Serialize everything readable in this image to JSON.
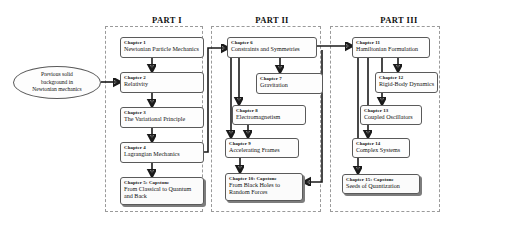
{
  "diagram": {
    "title_parts": [
      {
        "id": "part-1",
        "label": "PART I"
      },
      {
        "id": "part-2",
        "label": "PART II"
      },
      {
        "id": "part-3",
        "label": "PART III"
      }
    ],
    "entry": {
      "id": "previous-background",
      "text": "Previous solid background in Newtonian mechanics",
      "line1": "Previous solid",
      "line2": "background in",
      "line3": "Newtonian mechanics"
    },
    "nodes": [
      {
        "id": "chapter-1",
        "part": 1,
        "chapter": "Chapter 1",
        "title": "Newtonian Particle Mechanics",
        "capstone": false
      },
      {
        "id": "chapter-2",
        "part": 1,
        "chapter": "Chapter 2",
        "title": "Relativity",
        "capstone": false
      },
      {
        "id": "chapter-3",
        "part": 1,
        "chapter": "Chapter 3",
        "title": "The Variational Principle",
        "capstone": false
      },
      {
        "id": "chapter-4",
        "part": 1,
        "chapter": "Chapter 4",
        "title": "Lagrangian Mechanics",
        "capstone": false
      },
      {
        "id": "chapter-5",
        "part": 1,
        "chapter": "Chapter 5: Capstone",
        "title": "From Classical to Quantum and Back",
        "capstone": true
      },
      {
        "id": "chapter-6",
        "part": 2,
        "chapter": "Chapter 6",
        "title": "Constraints and Symmetries",
        "capstone": false
      },
      {
        "id": "chapter-7",
        "part": 2,
        "chapter": "Chapter 7",
        "title": "Gravitation",
        "capstone": false
      },
      {
        "id": "chapter-8",
        "part": 2,
        "chapter": "Chapter 8",
        "title": "Electromagnetism",
        "capstone": false
      },
      {
        "id": "chapter-9",
        "part": 2,
        "chapter": "Chapter 9",
        "title": "Accelerating Frames",
        "capstone": false
      },
      {
        "id": "chapter-10",
        "part": 2,
        "chapter": "Chapter 10: Capstone",
        "title": "From Black Holes to Random Forces",
        "capstone": true
      },
      {
        "id": "chapter-11",
        "part": 3,
        "chapter": "Chapter 11",
        "title": "Hamiltonian Formulation",
        "capstone": false
      },
      {
        "id": "chapter-12",
        "part": 3,
        "chapter": "Chapter 12",
        "title": "Rigid-Body Dynamics",
        "capstone": false
      },
      {
        "id": "chapter-13",
        "part": 3,
        "chapter": "Chapter 13",
        "title": "Coupled Oscillators",
        "capstone": false
      },
      {
        "id": "chapter-14",
        "part": 3,
        "chapter": "Chapter 14",
        "title": "Complex Systems",
        "capstone": false
      },
      {
        "id": "chapter-15",
        "part": 3,
        "chapter": "Chapter 15: Capstone",
        "title": "Seeds of Quantization",
        "capstone": true
      }
    ],
    "edges": [
      {
        "from": "previous-background",
        "to": "chapter-2"
      },
      {
        "from": "chapter-1",
        "to": "chapter-2"
      },
      {
        "from": "chapter-2",
        "to": "chapter-3"
      },
      {
        "from": "chapter-3",
        "to": "chapter-4"
      },
      {
        "from": "chapter-4",
        "to": "chapter-5"
      },
      {
        "from": "chapter-4",
        "to": "chapter-6"
      },
      {
        "from": "chapter-6",
        "to": "chapter-7"
      },
      {
        "from": "chapter-6",
        "to": "chapter-8"
      },
      {
        "from": "chapter-6",
        "to": "chapter-9"
      },
      {
        "from": "chapter-8",
        "to": "chapter-9"
      },
      {
        "from": "chapter-9",
        "to": "chapter-10"
      },
      {
        "from": "chapter-6",
        "to": "chapter-11"
      },
      {
        "from": "chapter-11",
        "to": "chapter-10"
      },
      {
        "from": "chapter-11",
        "to": "chapter-12"
      },
      {
        "from": "chapter-11",
        "to": "chapter-13"
      },
      {
        "from": "chapter-11",
        "to": "chapter-14"
      },
      {
        "from": "chapter-11",
        "to": "chapter-15"
      }
    ],
    "colors": {
      "box_border": "#5a5a5a",
      "region_border": "#9a9a9a",
      "arrow": "#1a1a1a",
      "shadow": "#7d7d7d",
      "text": "#111111",
      "background": "#ffffff"
    }
  }
}
